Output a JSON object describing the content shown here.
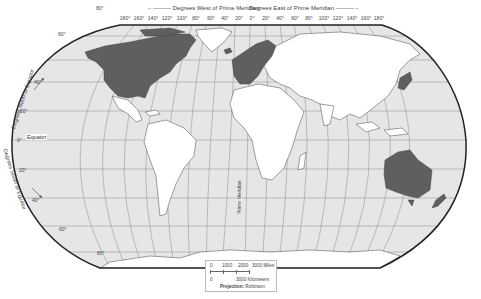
{
  "map": {
    "projection_label": "Projection:",
    "projection_value": "Robinson",
    "header_west": "←——— Degrees West of Prime Meridian",
    "header_east": "Degrees East of Prime Meridian ———→",
    "longitude_labels": [
      "180°",
      "160°",
      "140°",
      "120°",
      "100°",
      "80°",
      "60°",
      "40°",
      "20°",
      "0°",
      "20°",
      "40°",
      "60°",
      "80°",
      "100°",
      "120°",
      "140°",
      "160°",
      "180°"
    ],
    "latitude_labels": {
      "n80": "80°",
      "n60": "60°",
      "n40": "40°",
      "n20": "20°",
      "eq": "0°",
      "s20": "20°",
      "s40": "40°",
      "s60": "60°",
      "s80": "80°"
    },
    "north_side_label": "Degrees North of Equator",
    "south_side_label": "Degrees South of Equator",
    "equator_label": "Equator",
    "prime_meridian_label": "Prime Meridian",
    "scale": {
      "miles_ticks": [
        "0",
        "1000",
        "2000",
        "3000 Miles"
      ],
      "km_ticks": [
        "0",
        "3000 Kilometers"
      ]
    },
    "colors": {
      "ocean": "#e6e6e6",
      "land": "#ffffff",
      "highlight": "#5f5f5f",
      "border": "#222222",
      "graticule": "#8a8a8a"
    },
    "highlighted_regions": [
      "North America (USA & Canada)",
      "Western Europe",
      "Japan",
      "Australia",
      "New Zealand"
    ]
  }
}
